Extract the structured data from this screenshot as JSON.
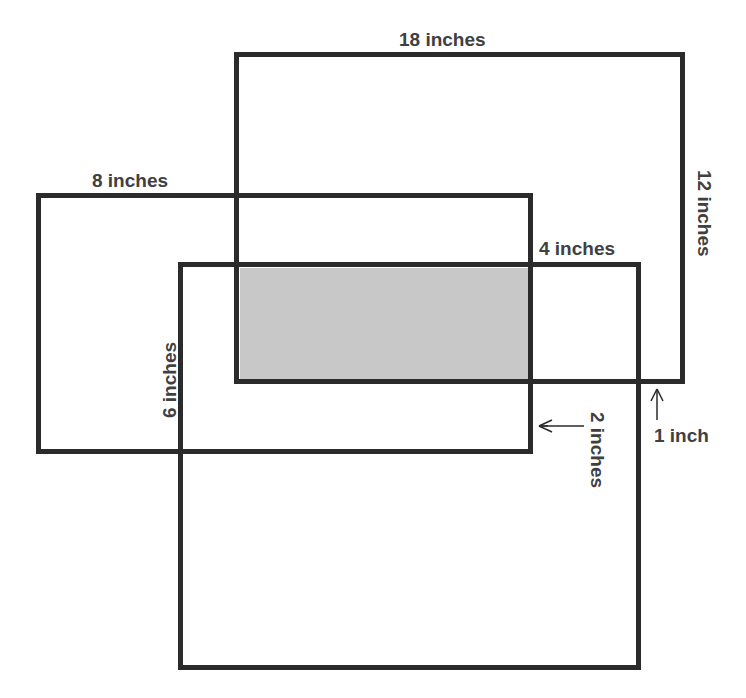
{
  "diagram": {
    "colors": {
      "border": "#2b2b2b",
      "shade": "#c8c8c8",
      "text": "#404040",
      "background": "#ffffff"
    },
    "rectangles": [
      {
        "id": "top-right-rect",
        "label": "18 inches",
        "side_label": "12 inches"
      },
      {
        "id": "left-rect",
        "label": "8 inches",
        "side_label": ""
      },
      {
        "id": "bottom-rect",
        "label": "4 inches",
        "side_label": "6 inches"
      }
    ],
    "labels": {
      "top_width": "18 inches",
      "top_height": "12 inches",
      "left_width": "8 inches",
      "bottom_segment": "4 inches",
      "bottom_height": "6 inches",
      "gap_right": "2 inches",
      "gap_bottom": "1 inch"
    },
    "shaded_region": "intersection of all three rectangles"
  }
}
